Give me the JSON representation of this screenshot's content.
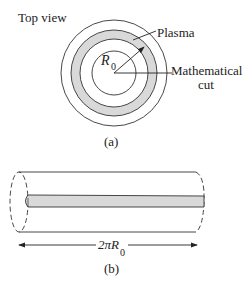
{
  "figure_a": {
    "title": "Top view",
    "plasma_label": "Plasma",
    "radius_label": "R",
    "radius_sub": "0",
    "cut_label_1": "Mathematical",
    "cut_label_2": "cut",
    "caption": "(a)"
  },
  "figure_b": {
    "length_label": "2πR",
    "length_sub": "0",
    "caption": "(b)"
  },
  "colors": {
    "plasma_fill": "#d9d9d9",
    "stroke": "#333333"
  }
}
